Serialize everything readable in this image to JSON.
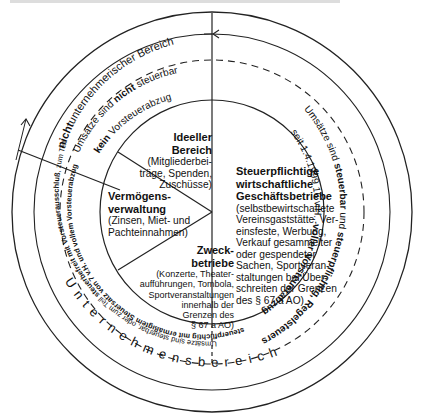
{
  "diagram": {
    "outer_ring_label": "Unternehmensbereich",
    "non_business": {
      "title_bold": "nicht",
      "title_rest": "unternehmerischer Bereich",
      "line1_a": "Umsätze sind ",
      "line1_b": "nicht",
      "line1_c": " steuerbar",
      "line2_a": "kein",
      "line2_b": " Vorsteuerabzug"
    },
    "segments": {
      "ideell": {
        "title": "Ideeller Bereich",
        "title_1": "Ideeller",
        "title_2": "Bereich",
        "desc_1": "(Mitgliederbei-",
        "desc_2": "träge, Spenden,",
        "desc_3": "Zuschüsse)"
      },
      "verm": {
        "title_1": "Vermögens-",
        "title_2": "verwaltung",
        "desc_1": "(Zinsen, Miet- und",
        "desc_2": "Pachteinnahmen)"
      },
      "zweck": {
        "title_1": "Zweck-",
        "title_2": "betriebe",
        "desc_1": "(Konzerte, Theater-",
        "desc_2": "aufführungen, Tombola,",
        "desc_3": "Sportveranstaltungen",
        "desc_4": "innerhalb der",
        "desc_5": "Grenzen des",
        "desc_6": "§ 67 a AO)"
      },
      "steuer": {
        "title_1": "Steuerpflichtige",
        "title_2": "wirtschaftliche",
        "title_3": "Geschäftsbetriebe",
        "desc_1": "(selbstbewirtschaftete",
        "desc_2": "Vereinsgaststätte, Ver-",
        "desc_3": "einsfeste, Werbung,",
        "desc_4": "Verkauf gesammelter",
        "desc_5": "oder gespendeter",
        "desc_6": "Sachen, Sportveran-",
        "desc_7": "staltungen bei Über-",
        "desc_8": "schreiten der Grenzen",
        "desc_9": "des § 67 a AO)"
      }
    },
    "right_arc": {
      "outer_a": "Umsätze sind ",
      "outer_b": "steuerbar",
      "outer_c": " und ",
      "outer_d": "steuerpflichtig, Regelsteuersatz",
      "inner_a": "seit 1.4.1999 16 v.H., ",
      "inner_b": "voller Vorsteuerabzug"
    },
    "left_arc": {
      "outer_a": "Umsätze sind steuerbar, oder zum Teil ",
      "outer_b": "steuerbefreit mit Vorsteuerausschluß",
      "outer_c": ", zum Teil",
      "inner": "steuerpflichtig mit ermäßigtem Steuersatz von 7 v.H. und vollem Vorsteuerabzug"
    }
  }
}
